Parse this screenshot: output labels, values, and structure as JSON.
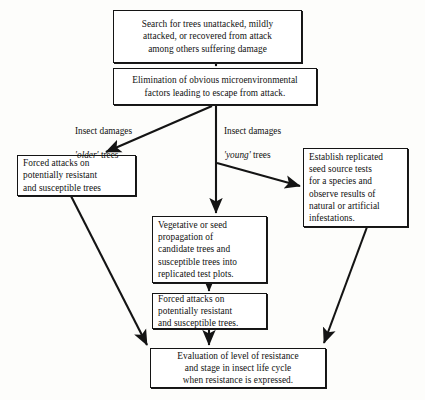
{
  "diagram": {
    "type": "flowchart",
    "stroke_color": "#141414",
    "background_color": "#fdfdfb",
    "nodes": [
      {
        "id": "search",
        "text": "Search for trees unattacked, mildly\nattacked, or recovered from attack\namong others suffering damage"
      },
      {
        "id": "elimination",
        "text": "Elimination of obvious microenvironmental\nfactors leading to escape from attack."
      },
      {
        "id": "forced_left",
        "text": "Forced attacks on\npotentially resistant\nand susceptible trees"
      },
      {
        "id": "establish",
        "text": "Establish replicated\nseed source tests\nfor a species and\nobserve results of\nnatural or artificial\ninfestations."
      },
      {
        "id": "vegetative",
        "text": "Vegetative or seed\npropagation of\ncandidate trees and\nsusceptible trees into\nreplicated test plots."
      },
      {
        "id": "forced_mid",
        "text": "Forced attacks on\npotentially resistant\nand susceptible trees."
      },
      {
        "id": "evaluation",
        "text": "Evaluation of level of resistance\nand stage in insect life cycle\nwhen resistance is expressed."
      }
    ],
    "edge_labels": [
      {
        "id": "older",
        "line1": "Insect damages",
        "line2_em": "'older'",
        "line2_rest": " trees"
      },
      {
        "id": "young",
        "line1": "Insect damages",
        "line2_em": "'young'",
        "line2_rest": " trees"
      }
    ],
    "edges": [
      {
        "from": "search",
        "to": "elimination"
      },
      {
        "from": "elimination",
        "to": "forced_left",
        "label": "older"
      },
      {
        "from": "elimination",
        "to": "establish",
        "label": "young"
      },
      {
        "from": "elimination",
        "to": "vegetative"
      },
      {
        "from": "vegetative",
        "to": "forced_mid"
      },
      {
        "from": "forced_mid",
        "to": "evaluation"
      },
      {
        "from": "forced_left",
        "to": "evaluation"
      },
      {
        "from": "establish",
        "to": "evaluation"
      }
    ]
  }
}
